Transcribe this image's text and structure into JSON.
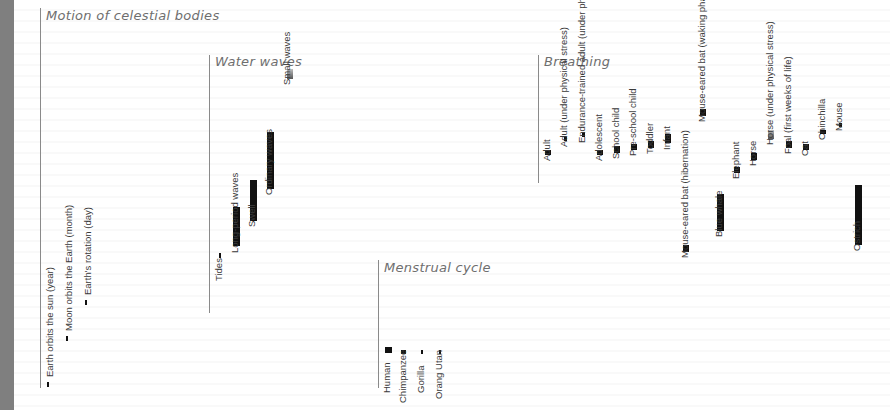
{
  "chart_data": [
    {
      "type": "bar",
      "title": "Motion of celestial bodies",
      "categories": [
        "Earth orbits the sun (year)",
        "Moon orbits the Earth (month)",
        "Earth's rotation (day)"
      ],
      "series": [
        {
          "name": "period",
          "values": [
            1,
            1,
            1
          ]
        }
      ],
      "note": "thin tick marks; relative extent"
    },
    {
      "type": "bar",
      "title": "Water waves",
      "categories": [
        "Tides",
        "Long-period waves",
        "Swell",
        "Ordinary waves",
        "Small waves"
      ],
      "series": [
        {
          "name": "range",
          "values": [
            [
              0.0,
              0.02
            ],
            [
              0.05,
              0.22
            ],
            [
              0.16,
              0.34
            ],
            [
              0.3,
              0.55
            ],
            [
              0.78,
              0.82
            ]
          ]
        }
      ],
      "highlight": [
        "Small waves"
      ]
    },
    {
      "type": "bar",
      "title": "Menstrual cycle",
      "categories": [
        "Human",
        "Chimpanzee",
        "Gorilla",
        "Orang Utan"
      ],
      "series": [
        {
          "name": "range",
          "values": [
            [
              0.0,
              0.06
            ],
            [
              0.0,
              0.03
            ],
            [
              0.0,
              0.03
            ],
            [
              0.0,
              0.03
            ]
          ]
        }
      ]
    },
    {
      "type": "bar",
      "title": "Breathing",
      "categories": [
        "Adult",
        "Adult (under physical stress)",
        "Endurance-trained adult (under phys. stress)",
        "Adolescent",
        "School child",
        "Pre-school child",
        "Toddler",
        "Infant",
        "Mouse-eared bat (hibernation)",
        "Mouse-eared bat (waking phase)",
        "Blue whale",
        "Elephant",
        "Horse",
        "Horse (under physical stress)",
        "Foal (first weeks of life)",
        "Cat",
        "Chinchilla",
        "Mouse",
        "Ostrich"
      ],
      "series": [
        {
          "name": "range",
          "values": [
            [
              0.0,
              0.02
            ],
            [
              0.06,
              0.08
            ],
            [
              0.08,
              0.1
            ],
            [
              0.0,
              0.02
            ],
            [
              0.01,
              0.04
            ],
            [
              0.02,
              0.05
            ],
            [
              0.03,
              0.06
            ],
            [
              0.05,
              0.09
            ],
            [
              -0.42,
              -0.39
            ],
            [
              0.17,
              0.2
            ],
            [
              -0.33,
              -0.17
            ],
            [
              -0.08,
              -0.05
            ],
            [
              -0.02,
              0.01
            ],
            [
              0.07,
              0.11
            ],
            [
              0.03,
              0.06
            ],
            [
              0.02,
              0.05
            ],
            [
              0.09,
              0.11
            ],
            [
              0.13,
              0.14
            ],
            [
              -0.39,
              -0.13
            ]
          ]
        }
      ],
      "highlight": [
        "Horse (under physical stress)"
      ]
    }
  ]
}
